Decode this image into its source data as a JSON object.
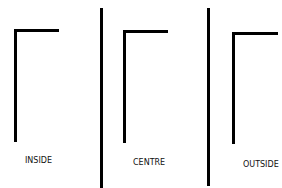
{
  "diagram": {
    "panels": [
      {
        "label": "INSIDE"
      },
      {
        "label": "CENTRE"
      },
      {
        "label": "OUTSIDE"
      }
    ],
    "colors": {
      "stroke": "#000000",
      "background": "#ffffff"
    }
  }
}
